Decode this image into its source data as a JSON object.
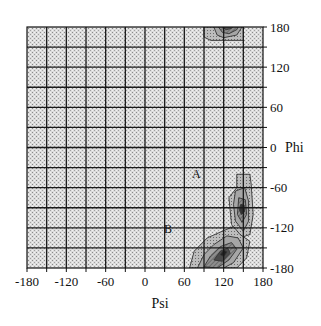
{
  "chart_data": {
    "type": "heatmap",
    "subtype": "ramachandran-contour",
    "title": "",
    "xlabel": "Psi",
    "ylabel": "Phi",
    "xlim": [
      -180,
      180
    ],
    "ylim": [
      -180,
      180
    ],
    "x_ticks": [
      -180,
      -120,
      -60,
      0,
      60,
      120,
      180
    ],
    "y_ticks": [
      180,
      120,
      60,
      0,
      -60,
      -120,
      -180
    ],
    "x_tick_labels": [
      "-180",
      "-120",
      "-60",
      "0",
      "60",
      "120",
      "180"
    ],
    "y_tick_labels": [
      "180",
      "120",
      "60",
      "0",
      "-60",
      "-120",
      "-180"
    ],
    "grid": true,
    "grid_step": 30,
    "y_axis_position": "right",
    "background_fill": "stippled light gray",
    "region_labels": [
      {
        "text": "A",
        "psi": 75,
        "phi": -45
      },
      {
        "text": "B",
        "psi": 30,
        "phi": -120
      }
    ],
    "contour_regions": [
      {
        "name": "top-cluster",
        "psi_range": [
          90,
          150
        ],
        "phi_range": [
          160,
          180
        ],
        "peak": {
          "psi": 120,
          "phi": 180
        }
      },
      {
        "name": "right-cluster",
        "psi_range": [
          125,
          165
        ],
        "phi_range": [
          -130,
          -40
        ],
        "peak": {
          "psi": 150,
          "phi": -90
        }
      },
      {
        "name": "lower-cluster",
        "psi_range": [
          65,
          160
        ],
        "phi_range": [
          -180,
          -110
        ],
        "peak": {
          "psi": 120,
          "phi": -150
        }
      }
    ]
  },
  "axes": {
    "xlabel": "Psi",
    "ylabel": "Phi"
  },
  "labels": {
    "region_a": "A",
    "region_b": "B"
  }
}
